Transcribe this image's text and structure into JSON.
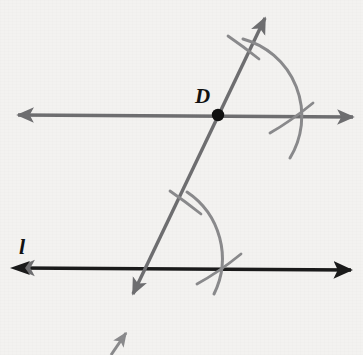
{
  "figure": {
    "background_color": "#f3f2f0",
    "width": 363,
    "height": 355,
    "labels": [
      {
        "id": "point-D",
        "text": "D",
        "x": 195,
        "y": 86
      },
      {
        "id": "line-l",
        "text": "l",
        "x": 19,
        "y": 236
      }
    ],
    "colors": {
      "upper_line": "#6e6e70",
      "lower_line": "#1a1a1a",
      "transversal": "#6e6e70",
      "arc": "#8a8a8c",
      "point": "#101010"
    },
    "points": [
      {
        "name": "D",
        "x": 218,
        "y": 115,
        "radius": 6,
        "filled": true
      }
    ],
    "lines": [
      {
        "name": "upper-line",
        "style": "double-arrow",
        "color": "#6e6e70",
        "stroke_width": 3.4,
        "x1": 16,
        "y1": 115,
        "x2": 355,
        "y2": 117
      },
      {
        "name": "lower-line-l",
        "style": "double-arrow",
        "color": "#1a1a1a",
        "stroke_width": 3.6,
        "x1": 16,
        "y1": 268,
        "x2": 353,
        "y2": 270
      },
      {
        "name": "transversal",
        "style": "double-arrow",
        "color": "#6e6e70",
        "stroke_width": 3.4,
        "x1": 268,
        "y1": 12,
        "x2": 129,
        "y2": 302
      },
      {
        "name": "transversal-lower-fragment",
        "style": "single-arrow",
        "color": "#8a8a8c",
        "stroke_width": 3.2,
        "x1": 112,
        "y1": 355,
        "x2": 124,
        "y2": 334
      }
    ],
    "arcs": [
      {
        "name": "upper-compass-arc",
        "center_x": 218,
        "center_y": 115,
        "radius": 80,
        "start_angle_deg": -72,
        "end_angle_deg": 30,
        "color": "#8a8a8c"
      },
      {
        "name": "lower-compass-arc",
        "center_x": 164,
        "center_y": 268,
        "radius": 80,
        "start_angle_deg": -74,
        "end_angle_deg": 22,
        "color": "#8a8a8c"
      }
    ],
    "tick_marks": [
      {
        "name": "upper-arc-tick-on-transversal",
        "x1": 230,
        "y1": 37,
        "x2": 258,
        "y2": 57
      },
      {
        "name": "upper-arc-tick-on-line",
        "x1": 273,
        "y1": 131,
        "x2": 312,
        "y2": 104
      },
      {
        "name": "lower-arc-tick-on-transversal",
        "x1": 172,
        "y1": 192,
        "x2": 200,
        "y2": 212
      },
      {
        "name": "lower-arc-tick-on-line",
        "x1": 200,
        "y1": 283,
        "x2": 240,
        "y2": 256
      }
    ],
    "intersections": [
      {
        "name": "transversal-upper-line",
        "x": 218,
        "y": 115
      },
      {
        "name": "transversal-lower-line",
        "x": 164,
        "y": 268
      },
      {
        "name": "upper-arc-upper-line",
        "x": 293,
        "y": 118
      },
      {
        "name": "lower-arc-lower-line",
        "x": 221,
        "y": 267
      }
    ]
  }
}
